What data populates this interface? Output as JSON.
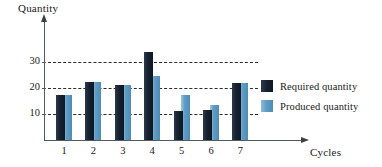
{
  "chart_data": {
    "type": "bar",
    "title": "",
    "xlabel": "Cycles",
    "ylabel": "Quantity",
    "categories": [
      "1",
      "2",
      "3",
      "4",
      "5",
      "6",
      "7"
    ],
    "series": [
      {
        "name": "Required quantity",
        "color": "#16202e",
        "values": [
          17.5,
          22.5,
          21,
          34,
          11,
          11.5,
          22
        ]
      },
      {
        "name": "Produced quantity",
        "color": "#5f9dc6",
        "values": [
          17.5,
          22.5,
          21,
          24.5,
          17.5,
          13.5,
          22
        ]
      }
    ],
    "ylim": [
      0,
      36
    ],
    "yticks": [
      10,
      20,
      30
    ],
    "ytick_labels": [
      "10",
      "20",
      "30"
    ],
    "grid": true,
    "grid_style": "dashed-horizontal",
    "legend_position": "right"
  },
  "axes": {
    "y_title": "Quantity",
    "x_title": "Cycles"
  },
  "legend": {
    "items": [
      {
        "label": "Required quantity",
        "swatch": "required-swatch"
      },
      {
        "label": "Produced quantity",
        "swatch": "produced-swatch"
      }
    ]
  },
  "icons": {
    "y_axis_arrow": "arrow-up-icon",
    "x_axis_arrow": "arrow-right-icon"
  }
}
